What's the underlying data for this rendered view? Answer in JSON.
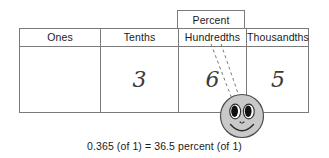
{
  "figure": {
    "callout": {
      "label": "Percent"
    },
    "table": {
      "headers": [
        "Ones",
        "Tenths",
        "Hundredths",
        "Thousandths"
      ],
      "digits": [
        "",
        "3",
        "6",
        "5"
      ]
    },
    "annotation": {
      "marker": "smiley-face",
      "leader_line_style": "dashed"
    },
    "caption": "0.365 (of 1) = 36.5 percent (of 1)",
    "colors": {
      "rule": "#7a7a7a",
      "text": "#1a1a1a",
      "digit": "#3a3a3a",
      "smiley_fill": "#c9c9c9",
      "smiley_stroke": "#4d4d4d",
      "background": "#ffffff"
    }
  }
}
